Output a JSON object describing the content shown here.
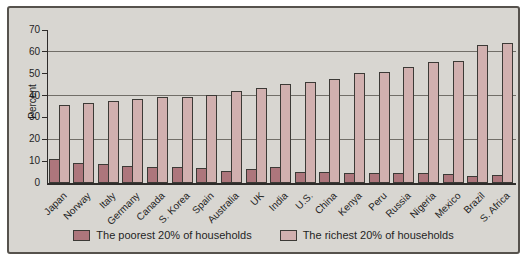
{
  "figure": {
    "background_color": "#d8d6d1",
    "border_color": "#56524d"
  },
  "chart_data": {
    "type": "bar",
    "title": "",
    "ylabel": "Percent",
    "xlabel": "",
    "ylim": [
      0,
      70
    ],
    "yticks": [
      0,
      10,
      20,
      30,
      40,
      50,
      60,
      70
    ],
    "gridlines": [
      20,
      40,
      60
    ],
    "grid": "horizontal",
    "legend_position": "bottom",
    "categories": [
      "Japan",
      "Norway",
      "Italy",
      "Germany",
      "Canada",
      "S. Korea",
      "Spain",
      "Australia",
      "UK",
      "India",
      "U.S.",
      "China",
      "Kenya",
      "Peru",
      "Russia",
      "Nigeria",
      "Mexico",
      "Brazil",
      "S. Africa"
    ],
    "series": [
      {
        "name": "The poorest 20% of households",
        "color": "#ad767c",
        "values": [
          10.8,
          9.3,
          8.5,
          8.0,
          7.3,
          7.2,
          7.0,
          5.5,
          6.2,
          7.5,
          5.2,
          5.1,
          4.6,
          4.4,
          4.4,
          4.6,
          4.0,
          3.2,
          3.7
        ]
      },
      {
        "name": "The richest 20% of households",
        "color": "#d1b0af",
        "values": [
          35.7,
          36.4,
          37.4,
          38.5,
          39.2,
          39.5,
          40.3,
          41.9,
          43.4,
          45.4,
          46.3,
          47.4,
          50.4,
          51.0,
          53.2,
          55.5,
          55.8,
          63.2,
          64.2
        ]
      }
    ]
  }
}
